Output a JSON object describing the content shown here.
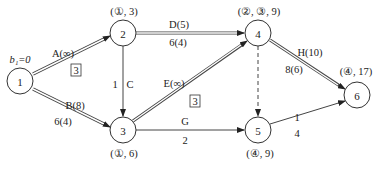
{
  "diagram": {
    "type": "network-flow",
    "source_label": "b₁=0",
    "nodes": [
      {
        "id": "1",
        "label": "1",
        "x": 20,
        "y": 81,
        "annotation": ""
      },
      {
        "id": "2",
        "label": "2",
        "x": 123,
        "y": 33,
        "annotation": "(①, 3)"
      },
      {
        "id": "3",
        "label": "3",
        "x": 123,
        "y": 130,
        "annotation": "(①, 6)"
      },
      {
        "id": "4",
        "label": "4",
        "x": 258,
        "y": 33,
        "annotation": "(②, ③, 9)"
      },
      {
        "id": "5",
        "label": "5",
        "x": 258,
        "y": 130,
        "annotation": "(④, 9)"
      },
      {
        "id": "6",
        "label": "6",
        "x": 357,
        "y": 95,
        "annotation": "(④, 17)"
      }
    ],
    "edges": [
      {
        "from": "1",
        "to": "2",
        "name": "A(∞)",
        "lower": "",
        "boxed": "3",
        "style": "double"
      },
      {
        "from": "1",
        "to": "3",
        "name": "B(8)",
        "lower": "6(4)",
        "boxed": "",
        "style": "double"
      },
      {
        "from": "2",
        "to": "3",
        "name": "C",
        "lower": "1",
        "boxed": "",
        "style": "single"
      },
      {
        "from": "2",
        "to": "4",
        "name": "D(5)",
        "lower": "6(4)",
        "boxed": "",
        "style": "double"
      },
      {
        "from": "3",
        "to": "4",
        "name": "E(∞)",
        "lower": "",
        "boxed": "3",
        "style": "double"
      },
      {
        "from": "3",
        "to": "5",
        "name": "G",
        "lower": "2",
        "boxed": "",
        "style": "single"
      },
      {
        "from": "4",
        "to": "5",
        "name": "",
        "lower": "",
        "boxed": "",
        "style": "dashed"
      },
      {
        "from": "4",
        "to": "6",
        "name": "H(10)",
        "lower": "8(6)",
        "boxed": "",
        "style": "double"
      },
      {
        "from": "5",
        "to": "6",
        "name": "1",
        "lower": "4",
        "boxed": "",
        "style": "single"
      }
    ]
  }
}
